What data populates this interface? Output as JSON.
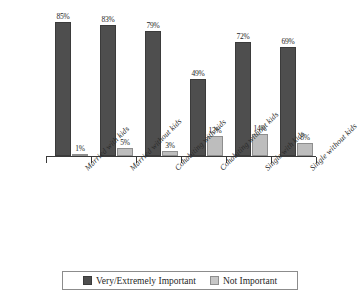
{
  "chart_data": {
    "type": "bar",
    "title": "",
    "subtitle": "",
    "xlabel": "",
    "ylabel": "",
    "ylim": [
      0,
      100
    ],
    "grid": false,
    "legend_position": "bottom",
    "value_suffix": "%",
    "categories": [
      "Married with kids",
      "Married without kids",
      "Cohabiting with kids",
      "Cohabiting without kids",
      "Single with kids",
      "Single without kids"
    ],
    "series": [
      {
        "name": "Very/Extremely Important",
        "color": "#4e4e4e",
        "values": [
          85,
          83,
          79,
          49,
          72,
          69
        ],
        "labels": [
          "85%",
          "83%",
          "79%",
          "49%",
          "72%",
          "69%"
        ]
      },
      {
        "name": "Not Important",
        "color": "#bdbdbd",
        "values": [
          1,
          5,
          3,
          13,
          14,
          8
        ],
        "labels": [
          "1%",
          "5%",
          "3%",
          "13%",
          "14%",
          "8%"
        ]
      }
    ]
  },
  "legend": {
    "items": [
      {
        "label": "Very/Extremely Important",
        "swatch": "dark"
      },
      {
        "label": "Not Important",
        "swatch": "light"
      }
    ]
  }
}
